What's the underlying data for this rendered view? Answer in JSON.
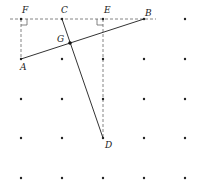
{
  "diagram": {
    "grid": {
      "xs": [
        21,
        62,
        103,
        144,
        185
      ],
      "ys": [
        19,
        59,
        99,
        138,
        178
      ],
      "dot_color": "#222222"
    },
    "points": {
      "F": {
        "label": "F",
        "x": 21,
        "y": 19
      },
      "C": {
        "label": "C",
        "x": 62,
        "y": 19
      },
      "E": {
        "label": "E",
        "x": 103,
        "y": 19
      },
      "B": {
        "label": "B",
        "x": 144,
        "y": 19
      },
      "A": {
        "label": "A",
        "x": 21,
        "y": 59
      },
      "D": {
        "label": "D",
        "x": 103,
        "y": 138
      },
      "G": {
        "label": "G",
        "x": 70,
        "y": 43
      }
    },
    "segments_solid": [
      "AB",
      "CD"
    ],
    "segments_dashed": [
      "top line through F and B",
      "FA",
      "ED"
    ],
    "right_angles": [
      "F",
      "E"
    ]
  }
}
